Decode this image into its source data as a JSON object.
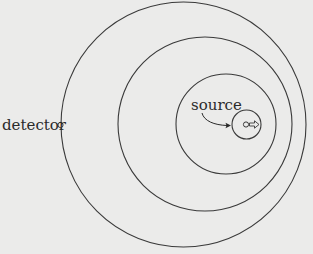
{
  "diagram": {
    "type": "concentric-wavefronts",
    "background_color": "#ebebea",
    "stroke_color": "#3a3a3a",
    "labels": {
      "detector": "detector",
      "source": "source"
    },
    "wavefronts": [
      {
        "cx": 183.5,
        "cy": 124.5,
        "r": 122.5
      },
      {
        "cx": 205,
        "cy": 124,
        "r": 87
      },
      {
        "cx": 226,
        "cy": 124,
        "r": 50
      },
      {
        "cx": 246.5,
        "cy": 124.5,
        "r": 14.5
      }
    ],
    "detector_point": {
      "cx": 60.5,
      "cy": 125,
      "r": 2.6
    },
    "source_point": {
      "cx": 246,
      "cy": 124.5,
      "r": 2.6
    },
    "motion_direction": "right"
  }
}
